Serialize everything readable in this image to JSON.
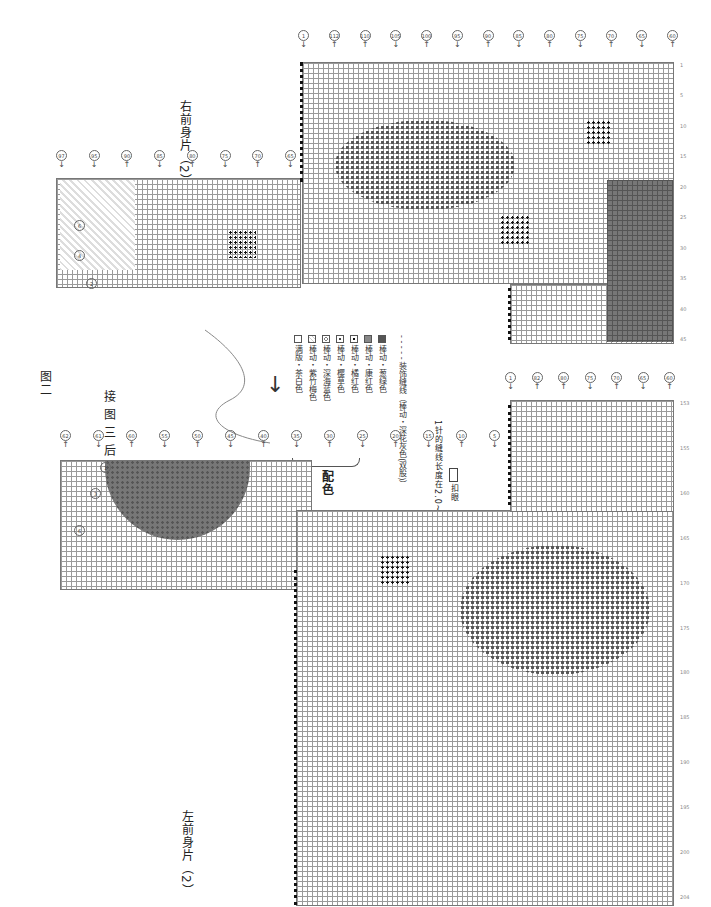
{
  "figure_label": "图二",
  "connector_note": "接图三后身片（1）",
  "pieces": [
    {
      "id": "right-front-2",
      "title": "右前身片（2）",
      "top_row_labels": [
        "1",
        "112",
        "110",
        "105",
        "100",
        "95",
        "90",
        "85",
        "80",
        "75",
        "70",
        "65",
        "60"
      ],
      "left_step_labels": [
        "97",
        "95",
        "90",
        "85",
        "80",
        "75",
        "70",
        "65",
        "60",
        "55",
        "50",
        "45",
        "40",
        "35",
        "30",
        "25",
        "20",
        "15",
        "10",
        "5"
      ],
      "step_markers": [
        "2",
        "4",
        "6"
      ],
      "column_numbers": [
        "1",
        "5",
        "10",
        "15",
        "20",
        "25",
        "30",
        "35",
        "40",
        "45"
      ]
    },
    {
      "id": "left-front-2",
      "title": "左前身片（2）",
      "top_row_labels": [
        "62",
        "61",
        "60",
        "55",
        "50",
        "45",
        "40",
        "35",
        "30",
        "25",
        "20",
        "15",
        "10",
        "5"
      ],
      "step_markers": [
        "1",
        "3",
        "6"
      ],
      "lower_section_labels": [
        "1",
        "82",
        "80",
        "75",
        "70",
        "65",
        "60"
      ],
      "column_numbers": [
        "153",
        "155",
        "160",
        "165",
        "170",
        "175",
        "180",
        "185",
        "190",
        "195",
        "200",
        "204"
      ]
    }
  ],
  "legend": {
    "heading": "配色",
    "items": [
      {
        "symbol": "empty-square",
        "label": "满版・茶白色"
      },
      {
        "symbol": "triangle-square",
        "label": "棒动・紫竹梅色"
      },
      {
        "symbol": "circle-square",
        "label": "棒动・深海蓝色"
      },
      {
        "symbol": "dot-circle-square",
        "label": "棒动・樱草色"
      },
      {
        "symbol": "dot-square",
        "label": "棒动・橘红色"
      },
      {
        "symbol": "gray-filled-square",
        "label": "棒动・康红色"
      },
      {
        "symbol": "dark-filled-square",
        "label": "棒动・葱绿色"
      }
    ],
    "stitch_line": "- - - - - 装饰缝线（棒动・深花灰色(双股)）",
    "stitch_note": "1针的缝线长度在2.0~3.5cm",
    "buttonhole_note": "扣眼"
  },
  "colors": {
    "grid_line": "#9a9a9a",
    "dark_fill": "#777777",
    "text": "#222222"
  }
}
